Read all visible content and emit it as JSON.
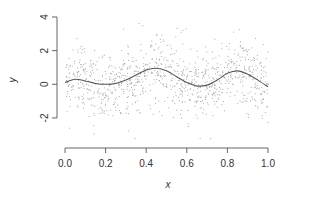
{
  "chart_data": {
    "type": "scatter",
    "title": "",
    "xlabel": "x",
    "ylabel": "y",
    "xlim": [
      0.0,
      1.0
    ],
    "ylim": [
      -3.2,
      4.2
    ],
    "grid": false,
    "legend": null,
    "x_ticks": [
      0.0,
      0.2,
      0.4,
      0.6,
      0.8,
      1.0
    ],
    "x_tick_labels": [
      "0.0",
      "0.2",
      "0.4",
      "0.6",
      "0.8",
      "1.0"
    ],
    "y_ticks": [
      -2,
      0,
      2,
      4
    ],
    "y_tick_labels": [
      "-2",
      "0",
      "2",
      "4"
    ],
    "series": [
      {
        "name": "noisy observations",
        "kind": "scatter",
        "n_points": 1000,
        "noise_sd": 1.0,
        "color": "#9a9a9a",
        "description": "Dense cloud of small grey dots around the smooth curve, spanning roughly y from -3 to 4"
      },
      {
        "name": "true function",
        "kind": "line",
        "color": "#555555",
        "x": [
          0.0,
          0.05,
          0.1,
          0.15,
          0.2,
          0.25,
          0.3,
          0.35,
          0.4,
          0.45,
          0.5,
          0.55,
          0.6,
          0.65,
          0.7,
          0.75,
          0.8,
          0.85,
          0.9,
          0.95,
          1.0
        ],
        "y": [
          0.1,
          0.3,
          0.2,
          0.05,
          0.0,
          0.05,
          0.25,
          0.55,
          0.85,
          0.95,
          0.8,
          0.45,
          0.1,
          -0.1,
          -0.05,
          0.25,
          0.65,
          0.8,
          0.6,
          0.25,
          -0.15
        ]
      }
    ]
  }
}
